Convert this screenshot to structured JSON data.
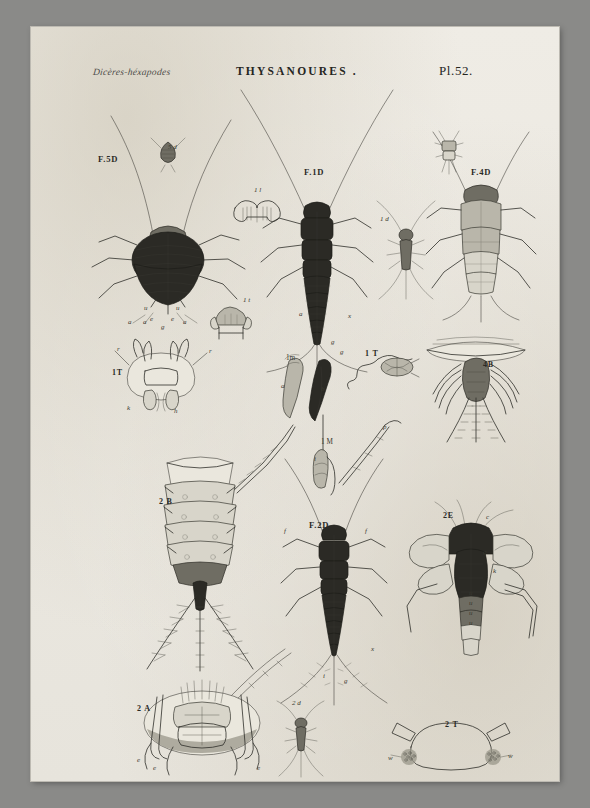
{
  "plate": {
    "header": {
      "script_note": "Dicères-héxapodes",
      "title": "THYSANOURES .",
      "plate_number": "Pl.52."
    },
    "figures": [
      {
        "id": "f5d",
        "label": "F.5D"
      },
      {
        "id": "f1d",
        "label": "F.1D"
      },
      {
        "id": "f4d",
        "label": "F.4D"
      },
      {
        "id": "f2d",
        "label": "F.2D"
      },
      {
        "id": "fig5d_inset",
        "label": "5 d"
      },
      {
        "id": "fig1d_inset",
        "label": "1 d"
      },
      {
        "id": "fig1l",
        "label": "1 l"
      },
      {
        "id": "fig1t_mouth",
        "label": "1 t"
      },
      {
        "id": "fig1T_head",
        "label": "1T"
      },
      {
        "id": "fig1m",
        "label": "1m"
      },
      {
        "id": "fig1T_ant",
        "label": "1 T"
      },
      {
        "id": "fig4b",
        "label": "4B"
      },
      {
        "id": "fig1M",
        "label": "1 M"
      },
      {
        "id": "fig2b",
        "label": "2 B"
      },
      {
        "id": "fig2a",
        "label": "2 A"
      },
      {
        "id": "fig2e",
        "label": "2E"
      },
      {
        "id": "fig2d_inset",
        "label": "2 d"
      },
      {
        "id": "fig2t",
        "label": "2 T"
      }
    ],
    "annotations": {
      "f5d": [
        "u",
        "u",
        "e",
        "e",
        "g",
        "a",
        "a",
        "a"
      ],
      "fig1T_head": [
        "r",
        "r",
        "k",
        "h"
      ],
      "fig1m": [
        "a",
        "b"
      ],
      "fig1M": [
        "i",
        "p"
      ],
      "fig1d_axis": [
        "a",
        "x",
        "g"
      ],
      "fig2d_f": [
        "f",
        "f"
      ],
      "f2d_axis": [
        "x",
        "i",
        "g"
      ],
      "fig2e": [
        "c",
        "g",
        "k",
        "u",
        "u",
        "u",
        "u"
      ],
      "fig2a": [
        "e",
        "e",
        "e"
      ],
      "fig2t": [
        "w",
        "w"
      ],
      "fig1m_axis": [
        "g"
      ]
    },
    "colors": {
      "paper": "#eceae3",
      "ink": "#2f2e29",
      "mount": "#8a8a88",
      "body_dark": "#2b2a25",
      "body_mid": "#6f6d63",
      "body_light": "#b9b6aa"
    }
  }
}
